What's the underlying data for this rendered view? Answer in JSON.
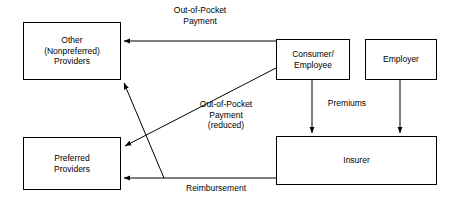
{
  "diagram": {
    "colors": {
      "stroke": "#000000",
      "background": "#ffffff",
      "text": "#000000"
    },
    "nodes": {
      "other_providers": {
        "label": "Other\n(Nonpreferred)\nProviders"
      },
      "consumer": {
        "label": "Consumer/\nEmployee"
      },
      "employer": {
        "label": "Employer"
      },
      "insurer": {
        "label": "Insurer"
      },
      "preferred_providers": {
        "label": "Preferred\nProviders"
      }
    },
    "edges": {
      "out_of_pocket_payment": {
        "label": "Out-of-Pocket\nPayment",
        "from": "consumer",
        "to": "other_providers"
      },
      "out_of_pocket_payment_reduced": {
        "label": "Out-of-Pocket\nPayment\n(reduced)",
        "from": "consumer",
        "to": "preferred_providers"
      },
      "premiums": {
        "label": "Premiums",
        "from": "consumer",
        "to": "insurer"
      },
      "employer_premiums": {
        "label": "",
        "from": "employer",
        "to": "insurer"
      },
      "reimbursement": {
        "label": "Reimbursement",
        "from": "insurer",
        "to": "preferred_providers"
      },
      "reimbursement_other": {
        "label": "",
        "from": "insurer",
        "to": "other_providers"
      }
    }
  }
}
